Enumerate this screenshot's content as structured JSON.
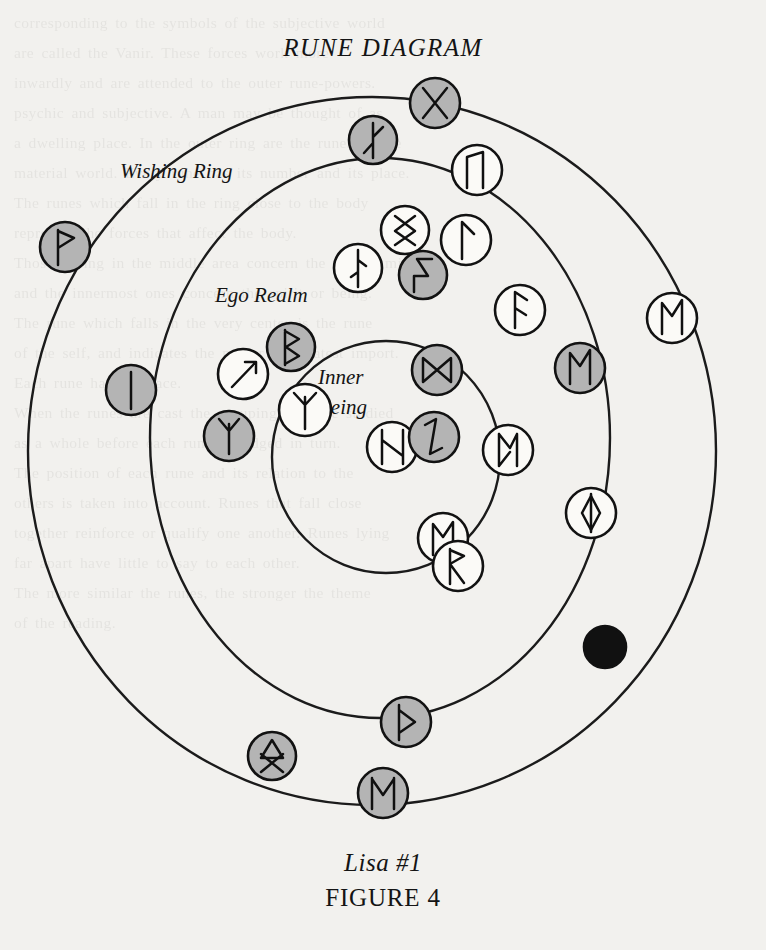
{
  "title": "RUNE DIAGRAM",
  "caption": {
    "line1": "Lisa #1",
    "line2": "FIGURE 4"
  },
  "colors": {
    "page_background": "#f2f1ee",
    "ink": "#1b1b1b",
    "rune_fill_gray": "#b4b4b4",
    "rune_fill_white": "#fbfaf7",
    "rune_fill_black": "#111111"
  },
  "rings": [
    {
      "id": "outer",
      "label": "Wishing Ring",
      "label_x": 120,
      "label_y": 178,
      "cx": 372,
      "cy": 451,
      "rx": 344,
      "ry": 354,
      "stroke_width": 2.4
    },
    {
      "id": "middle",
      "label": "Ego Realm",
      "label_x": 215,
      "label_y": 302,
      "cx": 380,
      "cy": 438,
      "rx": 230,
      "ry": 280,
      "stroke_width": 2.4
    },
    {
      "id": "inner",
      "label": "Inner",
      "label2": "Being",
      "label_x": 318,
      "label_y": 384,
      "label2_x": 318,
      "label2_y": 412,
      "cx": 386,
      "cy": 457,
      "rx": 114,
      "ry": 116,
      "stroke_width": 2.4
    }
  ],
  "chart_data": {
    "type": "diagram",
    "title": "RUNE DIAGRAM",
    "subtitle": "Lisa #1",
    "figure_label": "FIGURE 4",
    "ring_labels": [
      "Wishing Ring",
      "Ego Realm",
      "Inner Being"
    ],
    "ring_count": 3,
    "token_count": 25,
    "fill_legend": {
      "gray": "shaded / reversed rune",
      "white": "upright rune",
      "black": "blank rune"
    },
    "tokens": [
      {
        "name": "gebo",
        "glyph": "X",
        "fill": "gray",
        "x": 435,
        "y": 103,
        "r": 25,
        "ring": "outer-edge"
      },
      {
        "name": "algiz-a",
        "glyph": "branch-up",
        "fill": "gray",
        "x": 373,
        "y": 140,
        "r": 24,
        "ring": "wishing"
      },
      {
        "name": "uruz",
        "glyph": "uruz",
        "fill": "white",
        "x": 477,
        "y": 170,
        "r": 25,
        "ring": "wishing"
      },
      {
        "name": "wunjo",
        "glyph": "wunjo",
        "fill": "gray",
        "x": 65,
        "y": 247,
        "r": 25,
        "ring": "wishing"
      },
      {
        "name": "inguz-x",
        "glyph": "inguz-x",
        "fill": "white",
        "x": 405,
        "y": 230,
        "r": 24,
        "ring": "ego"
      },
      {
        "name": "laguz-i",
        "glyph": "laguz-i",
        "fill": "white",
        "x": 358,
        "y": 268,
        "r": 24,
        "ring": "ego"
      },
      {
        "name": "sowilo",
        "glyph": "sowilo",
        "fill": "gray",
        "x": 423,
        "y": 275,
        "r": 24,
        "ring": "ego"
      },
      {
        "name": "laguz-a",
        "glyph": "laguz-a",
        "fill": "white",
        "x": 466,
        "y": 240,
        "r": 25,
        "ring": "ego"
      },
      {
        "name": "ansuz",
        "glyph": "ansuz",
        "fill": "white",
        "x": 520,
        "y": 310,
        "r": 25,
        "ring": "ego"
      },
      {
        "name": "ehwaz-r",
        "glyph": "ehwaz",
        "fill": "white",
        "x": 672,
        "y": 318,
        "r": 25,
        "ring": "wishing"
      },
      {
        "name": "isa",
        "glyph": "isa",
        "fill": "gray",
        "x": 131,
        "y": 390,
        "r": 25,
        "ring": "wishing"
      },
      {
        "name": "tiwaz-arrow",
        "glyph": "arrow",
        "fill": "white",
        "x": 243,
        "y": 374,
        "r": 25,
        "ring": "ego"
      },
      {
        "name": "berkana",
        "glyph": "berkana",
        "fill": "gray",
        "x": 291,
        "y": 347,
        "r": 24,
        "ring": "ego"
      },
      {
        "name": "dagaz",
        "glyph": "dagaz",
        "fill": "gray",
        "x": 437,
        "y": 370,
        "r": 25,
        "ring": "inner"
      },
      {
        "name": "ehwaz-r2",
        "glyph": "ehwaz",
        "fill": "gray",
        "x": 580,
        "y": 368,
        "r": 25,
        "ring": "ego"
      },
      {
        "name": "algiz-y1",
        "glyph": "algiz",
        "fill": "white",
        "x": 305,
        "y": 410,
        "r": 26,
        "ring": "inner"
      },
      {
        "name": "algiz-y2",
        "glyph": "algiz",
        "fill": "gray",
        "x": 229,
        "y": 436,
        "r": 25,
        "ring": "ego"
      },
      {
        "name": "hagalaz",
        "glyph": "hagalaz",
        "fill": "white",
        "x": 392,
        "y": 447,
        "r": 25,
        "ring": "inner"
      },
      {
        "name": "laguz-z",
        "glyph": "laguz-z",
        "fill": "gray",
        "x": 434,
        "y": 437,
        "r": 25,
        "ring": "inner"
      },
      {
        "name": "perthro",
        "glyph": "perthro",
        "fill": "white",
        "x": 508,
        "y": 450,
        "r": 25,
        "ring": "ego"
      },
      {
        "name": "inguz-o",
        "glyph": "inguz",
        "fill": "white",
        "x": 591,
        "y": 513,
        "r": 25,
        "ring": "ego"
      },
      {
        "name": "mannaz",
        "glyph": "mannaz",
        "fill": "white",
        "x": 443,
        "y": 538,
        "r": 25,
        "ring": "ego"
      },
      {
        "name": "raido",
        "glyph": "raido",
        "fill": "white",
        "x": 458,
        "y": 566,
        "r": 25,
        "ring": "ego"
      },
      {
        "name": "blank",
        "glyph": "blank",
        "fill": "black",
        "x": 605,
        "y": 647,
        "r": 21,
        "ring": "wishing"
      },
      {
        "name": "thurisaz",
        "glyph": "thurisaz",
        "fill": "gray",
        "x": 406,
        "y": 722,
        "r": 25,
        "ring": "middle-edge"
      },
      {
        "name": "othala",
        "glyph": "othala",
        "fill": "gray",
        "x": 272,
        "y": 756,
        "r": 24,
        "ring": "wishing"
      },
      {
        "name": "ehwaz-m",
        "glyph": "ehwaz-m",
        "fill": "gray",
        "x": 383,
        "y": 793,
        "r": 25,
        "ring": "outer-edge"
      }
    ]
  },
  "ghost_text": {
    "lines": [
      "   corresponding to the symbols of the subjective world",
      "   are called the Vanir. These forces work more",
      "   inwardly and are attended to the outer rune-powers.",
      "   psychic and subjective. A man may be thought of as",
      "   a dwelling place. In the outer ring are the runes of the",
      "   material world. Every rune has its number and its place.",
      "   The runes which fall in the ring close to the body",
      "   represent the forces that affect the body.",
      "   Those falling in the middle area concern the ego or mind,",
      "   and the innermost ones concern the spirit or being.",
      "   The rune which falls in the very center is the rune",
      "   of the self, and indicates the matter of greatest import.",
      "   Each rune has its place.",
      "",
      "   When the runes are cast the grouping must be studied",
      "   as a whole before each rune is judged in turn.",
      "   The position of each rune and its relation to the",
      "   others is taken into account. Runes that fall close",
      "   together reinforce or qualify one another. Runes lying",
      "   far apart have little to say to each other.",
      "   The more similar the runes, the stronger the theme",
      "   of the reading."
    ]
  }
}
